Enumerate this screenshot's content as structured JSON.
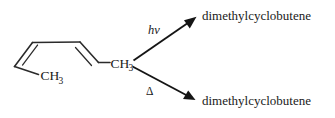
{
  "diagram": {
    "background_color": "#ffffff",
    "line_color": "#2b2b2b"
  },
  "reactant": {
    "name": "2,4-hexadiene",
    "methyl_left": "CH",
    "methyl_left_sub": "3",
    "methyl_right": "CH",
    "methyl_right_sub": "3"
  },
  "pathways": [
    {
      "id": "photochemical",
      "condition_label": "hv",
      "product_label": "dimethylcyclobutene",
      "direction": "up-right"
    },
    {
      "id": "thermal",
      "condition_label": "Δ",
      "product_label": "dimethylcyclobutene",
      "direction": "down-right"
    }
  ]
}
